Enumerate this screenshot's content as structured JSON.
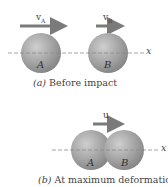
{
  "panel_a": {
    "velocity_a_label": "v",
    "velocity_a_sub": "A",
    "velocity_b_label": "v",
    "velocity_b_sub": "B",
    "sphere_a_label": "A",
    "sphere_b_label": "B",
    "axis_label": "x",
    "caption_letter": "(a)",
    "caption_text": " Before impact"
  },
  "panel_b": {
    "velocity_label": "u",
    "sphere_a_label": "A",
    "sphere_b_label": "B",
    "axis_label": "x",
    "caption_letter": "(b)",
    "caption_text": " At maximum deformation"
  },
  "colors": {
    "sphere": "#8f8f8f",
    "arrow": "#7a7a7a",
    "axis": "#8a8a8a",
    "text": "#444444"
  }
}
